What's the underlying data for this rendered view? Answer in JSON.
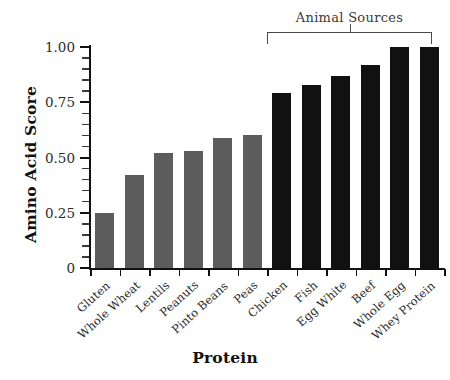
{
  "chart_data": {
    "type": "bar",
    "title": "",
    "xlabel": "Protein",
    "ylabel": "Amino Acid Score",
    "categories": [
      "Gluten",
      "Whole Wheat",
      "Lentils",
      "Peanuts",
      "Pinto Beans",
      "Peas",
      "Chicken",
      "Fish",
      "Egg White",
      "Beef",
      "Whole Egg",
      "Whey Protein"
    ],
    "values": [
      0.25,
      0.42,
      0.52,
      0.53,
      0.59,
      0.6,
      0.79,
      0.83,
      0.87,
      0.92,
      1.0,
      1.0
    ],
    "bar_colors": [
      "#5c5c5c",
      "#5c5c5c",
      "#5c5c5c",
      "#5c5c5c",
      "#5c5c5c",
      "#5c5c5c",
      "#111111",
      "#111111",
      "#111111",
      "#111111",
      "#111111",
      "#111111"
    ],
    "ylim": [
      0,
      1.0
    ],
    "ytick_labels": [
      "0",
      "0.25",
      "0.50",
      "0.75",
      "1.00"
    ],
    "ytick_values": [
      0,
      0.25,
      0.5,
      0.75,
      1.0
    ],
    "yminor_values": [
      0.05,
      0.1,
      0.15,
      0.2,
      0.3,
      0.35,
      0.4,
      0.45,
      0.55,
      0.6,
      0.65,
      0.7,
      0.8,
      0.85,
      0.9,
      0.95
    ],
    "grid": false,
    "legend": false,
    "annotations": [
      {
        "text": "Animal Sources",
        "spans_categories": [
          "Chicken",
          "Fish",
          "Egg White",
          "Beef",
          "Whole Egg",
          "Whey Protein"
        ],
        "style": "bracket-above"
      }
    ],
    "colors": {
      "plant_group": "#5c5c5c",
      "animal_group": "#111111",
      "axis": "#111111",
      "annotation": "#4a4a4a",
      "background": "#ffffff"
    }
  }
}
